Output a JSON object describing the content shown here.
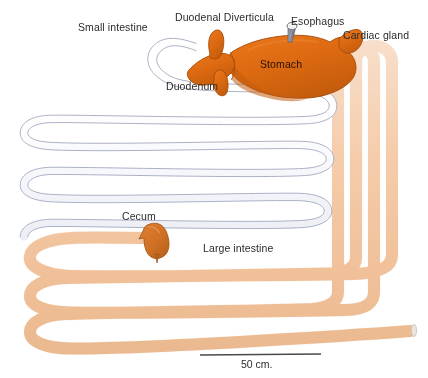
{
  "figure": {
    "background_color": "#ffffff"
  },
  "labels": {
    "small_intestine": "Small intestine",
    "duodenal_diverticula": "Duodenal Diverticula",
    "esophagus": "Esophagus",
    "cardiac_gland": "Cardiac gland",
    "stomach": "Stomach",
    "duodenum": "Duodenum",
    "cecum": "Cecum",
    "large_intestine": "Large intestine"
  },
  "scale_bar": {
    "caption": "50 cm.",
    "line_color": "#4a4a4a"
  },
  "colors": {
    "stomach_fill": "#dd6a11",
    "stomach_shadow": "#b9530a",
    "stomach_outline": "#a64a08",
    "cecum_fill": "#d3762a",
    "cecum_outline": "#a85a18",
    "small_intestine_fill": "#fbfbfd",
    "small_intestine_outline": "#a9aec4",
    "large_intestine_fill": "#f7d3b3",
    "large_intestine_outline": "#e8bb94",
    "esophagus_fill": "#7e8290",
    "esophagus_opening": "#f4f4f2",
    "label_text": "#2b2b2b"
  }
}
